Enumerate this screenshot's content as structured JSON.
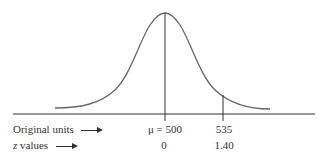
{
  "diagram": {
    "type": "normal-distribution",
    "colors": {
      "curve": "#555555",
      "axis": "#333333",
      "text": "#333333"
    },
    "rows": [
      {
        "label": "Original units",
        "values": [
          "μ = 500",
          "535"
        ]
      },
      {
        "label": "z values",
        "label_var": "z",
        "label_rest": " values",
        "values": [
          "0",
          "1.40"
        ]
      }
    ],
    "markers": [
      {
        "name": "mean",
        "original": "μ = 500",
        "z": "0"
      },
      {
        "name": "value",
        "original": "535",
        "z": "1.40"
      }
    ]
  }
}
